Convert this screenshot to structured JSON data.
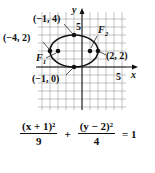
{
  "graph": {
    "axis_labels": {
      "x": "x",
      "y": "y"
    },
    "tick_labels": {
      "x": "5",
      "y": "5"
    },
    "points": [
      {
        "label": "(−1, 4)",
        "x": -1,
        "y": 4
      },
      {
        "label": "(−4, 2)",
        "x": -4,
        "y": 2
      },
      {
        "label": "(2, 2)",
        "x": 2,
        "y": 2
      },
      {
        "label": "(−1, 0)",
        "x": -1,
        "y": 0
      }
    ],
    "foci": [
      {
        "label": "F",
        "subscript": "1",
        "x": -3.24,
        "y": 2
      },
      {
        "label": "F",
        "subscript": "2",
        "x": 1.24,
        "y": 2
      }
    ],
    "ellipse": {
      "center_x": -1,
      "center_y": 2,
      "a": 3,
      "b": 2
    },
    "colors": {
      "curve": "#111111",
      "grid": "#9a9a9a",
      "axis": "#111111"
    }
  },
  "equation": {
    "term1_numerator": "(x + 1)²",
    "term1_denominator": "9",
    "plus": "+",
    "term2_numerator": "(y − 2)²",
    "term2_denominator": "4",
    "equals": "= 1"
  }
}
